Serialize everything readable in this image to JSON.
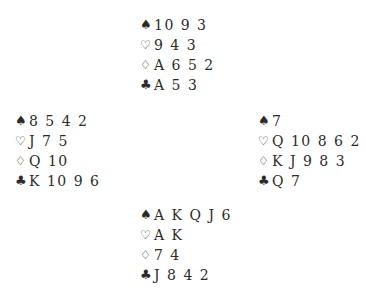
{
  "suits": {
    "spades": "♠",
    "hearts": "♡",
    "diamonds": "♢",
    "clubs": "♣"
  },
  "hands": {
    "north": {
      "spades": "10 9 3",
      "hearts": "9 4 3",
      "diamonds": "A 6 5 2",
      "clubs": "A 5 3"
    },
    "west": {
      "spades": "8 5 4 2",
      "hearts": "J 7 5",
      "diamonds": "Q 10",
      "clubs": "K 10 9 6"
    },
    "east": {
      "spades": "7",
      "hearts": "Q 10 8 6 2",
      "diamonds": "K J 9 8 3",
      "clubs": "Q 7"
    },
    "south": {
      "spades": "A K Q J 6",
      "hearts": "A K",
      "diamonds": "7 4",
      "clubs": "J 8 4 2"
    }
  }
}
